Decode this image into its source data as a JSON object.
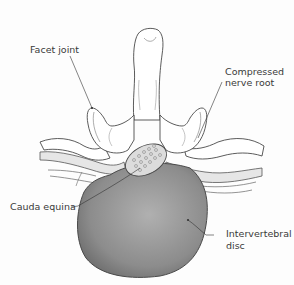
{
  "diagram": {
    "type": "anatomical-illustration",
    "colors": {
      "background": "#fdfdfd",
      "outline": "#4a4a4a",
      "bone_fill": "#ffffff",
      "disc_fill_light": "#a8a8a8",
      "disc_fill_dark": "#707070",
      "nerve_fill": "#e4e4e4",
      "cauda_fill": "#dcdcdc",
      "label_text": "#3a3a3a"
    },
    "labels": {
      "facet_joint": "Facet joint",
      "compressed_nerve_root_line1": "Compressed",
      "compressed_nerve_root_line2": "nerve root",
      "cauda_equina": "Cauda equina",
      "intervertebral_disc_line1": "Intervertebral",
      "intervertebral_disc_line2": "disc"
    }
  }
}
